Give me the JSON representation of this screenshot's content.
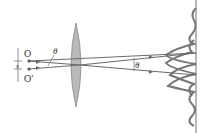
{
  "labels": {
    "source_top": "O",
    "source_bottom": "O′",
    "separation": "s",
    "angle_left": "θ",
    "angle_right": "θ"
  },
  "colors": {
    "line": "#6b6b6b",
    "lens_fill": "#b9b9b9",
    "lens_stroke": "#8a8a8a",
    "text": "#333333",
    "background": "#ffffff"
  }
}
